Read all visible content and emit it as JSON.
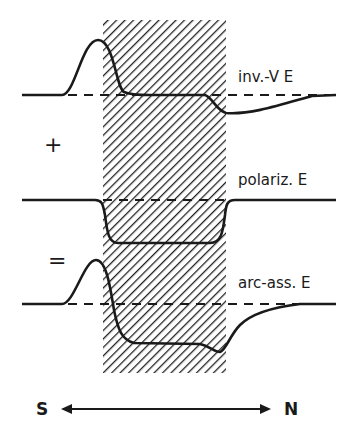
{
  "diagram": {
    "hatched_region": {
      "x": 103,
      "y": 20,
      "width": 123,
      "height": 353,
      "pattern": "diagonal-hatch",
      "color": "#222222"
    },
    "curves": [
      {
        "id": "inv-v-e",
        "label": "inv.-V E",
        "baseline_y": 95
      },
      {
        "id": "polariz-e",
        "label": "polariz. E",
        "baseline_y": 200
      },
      {
        "id": "arc-ass-e",
        "label": "arc-ass. E",
        "baseline_y": 304
      }
    ],
    "operators": {
      "plus": "+",
      "equals": "="
    },
    "axis": {
      "left_label": "S",
      "right_label": "N"
    },
    "colors": {
      "ink": "#1a1a1a",
      "background": "#ffffff"
    }
  }
}
